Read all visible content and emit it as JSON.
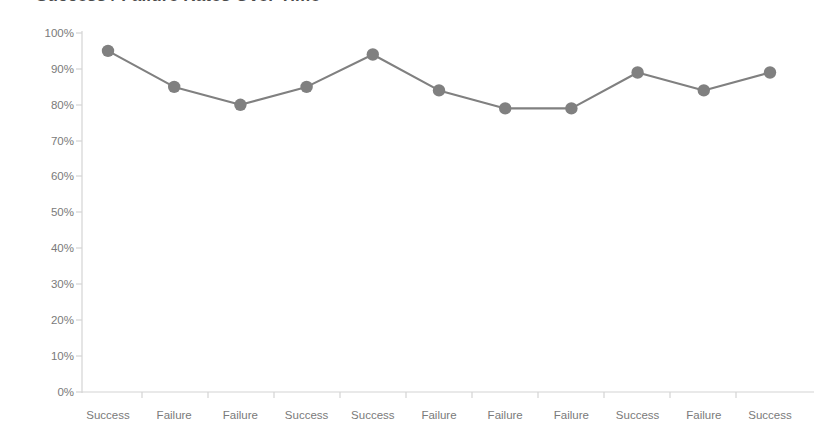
{
  "chart": {
    "title": "Success / Failure Rates Over Time",
    "accent_color": "#808080",
    "axis_color": "#d4d4d4",
    "text_color": "#7a7a7a"
  },
  "chart_data": {
    "type": "line",
    "title": "Success / Failure Rates Over Time",
    "xlabel": "",
    "ylabel": "",
    "ylim": [
      0,
      100
    ],
    "yticks": [
      "0%",
      "10%",
      "20%",
      "30%",
      "40%",
      "50%",
      "60%",
      "70%",
      "80%",
      "90%",
      "100%"
    ],
    "ytick_values": [
      0,
      10,
      20,
      30,
      40,
      50,
      60,
      70,
      80,
      90,
      100
    ],
    "grid": false,
    "legend": "none",
    "marker": "circle",
    "categories": [
      "Success",
      "Failure",
      "Failure",
      "Success",
      "Success",
      "Failure",
      "Failure",
      "Failure",
      "Success",
      "Failure",
      "Success"
    ],
    "values": [
      95,
      85,
      80,
      85,
      94,
      84,
      79,
      79,
      89,
      84,
      89
    ],
    "series": [
      {
        "name": "Rate",
        "values": [
          95,
          85,
          80,
          85,
          94,
          84,
          79,
          79,
          89,
          84,
          89
        ]
      }
    ]
  }
}
